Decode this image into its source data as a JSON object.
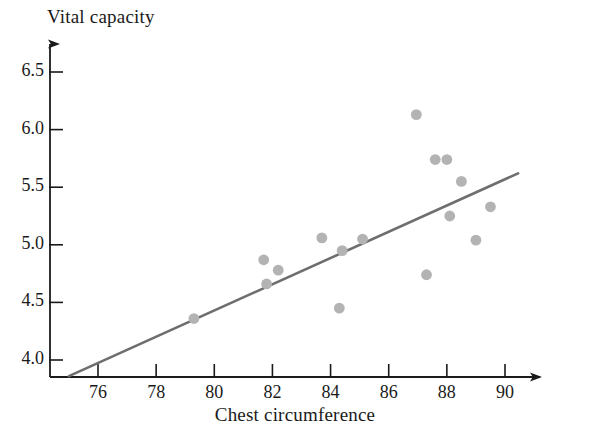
{
  "chart_data": {
    "type": "scatter",
    "title": "",
    "xlabel": "Chest circumference",
    "ylabel": "Vital capacity",
    "xlim": [
      74.2,
      91.6
    ],
    "ylim": [
      3.82,
      6.72
    ],
    "xticks": [
      76,
      78,
      80,
      82,
      84,
      86,
      88,
      90
    ],
    "yticks": [
      "4.0",
      "4.5",
      "5.0",
      "5.5",
      "6.0",
      "6.5"
    ],
    "ytick_values": [
      4.0,
      4.5,
      5.0,
      5.5,
      6.0,
      6.5
    ],
    "grid": false,
    "legend": false,
    "point_color": "#b3b3b3",
    "line_color": "#6e6e6e",
    "axis_color": "#1a1a1a",
    "points": [
      {
        "x": 79.3,
        "y": 4.36
      },
      {
        "x": 81.7,
        "y": 4.87
      },
      {
        "x": 81.8,
        "y": 4.66
      },
      {
        "x": 82.2,
        "y": 4.78
      },
      {
        "x": 83.7,
        "y": 5.06
      },
      {
        "x": 84.3,
        "y": 4.45
      },
      {
        "x": 84.4,
        "y": 4.95
      },
      {
        "x": 85.1,
        "y": 5.05
      },
      {
        "x": 86.95,
        "y": 6.13
      },
      {
        "x": 87.3,
        "y": 4.74
      },
      {
        "x": 87.6,
        "y": 5.74
      },
      {
        "x": 88.0,
        "y": 5.74
      },
      {
        "x": 88.1,
        "y": 5.25
      },
      {
        "x": 88.5,
        "y": 5.55
      },
      {
        "x": 89.0,
        "y": 5.04
      },
      {
        "x": 89.5,
        "y": 5.33
      }
    ],
    "trendline": {
      "x_start": 75.0,
      "y_start": 3.86,
      "x_end": 90.45,
      "y_end": 5.62
    }
  },
  "labels": {
    "y_axis_title": "Vital capacity",
    "x_axis_title": "Chest circumference"
  }
}
